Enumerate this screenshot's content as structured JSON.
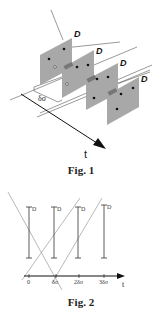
{
  "figure1": {
    "caption": "Fig. 1",
    "plane_label": "D",
    "spacing_label": "δσ",
    "axis_label": "t",
    "plane_color": "#a8a8a8",
    "plane_count": 4
  },
  "figure2": {
    "caption": "Fig. 2",
    "axis_label": "t",
    "bar_label": "D",
    "ticks": [
      "0",
      "δσ",
      "2δσ",
      "3δσ"
    ],
    "bar_count": 4
  }
}
